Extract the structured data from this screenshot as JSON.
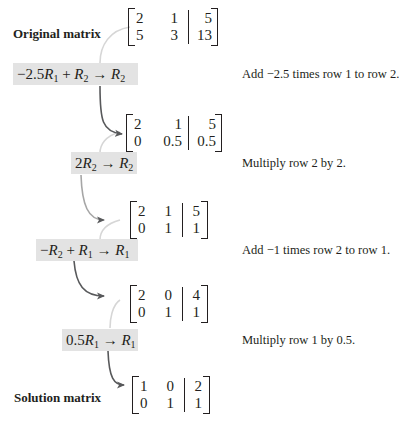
{
  "labels": {
    "original": "Original matrix",
    "solution": "Solution matrix"
  },
  "steps": [
    {
      "operation": {
        "coef": "−2.5",
        "r_a": "1",
        "plus": " + ",
        "r_b": "2",
        "arrow": " → ",
        "r_target": "2"
      },
      "description": "Add −2.5 times row 1 to row 2."
    },
    {
      "operation": {
        "coef": "2",
        "r_a": "2",
        "arrow": " → ",
        "r_target": "2"
      },
      "description": "Multiply row 2 by 2."
    },
    {
      "operation": {
        "coef": "−",
        "r_a": "2",
        "plus": " + ",
        "r_b": "1",
        "arrow": " → ",
        "r_target": "1"
      },
      "description": "Add −1 times row 2 to row 1."
    },
    {
      "operation": {
        "coef": "0.5",
        "r_a": "1",
        "arrow": " → ",
        "r_target": "1"
      },
      "description": "Multiply row 1 by 0.5."
    }
  ],
  "matrices": [
    {
      "rows": [
        [
          "2",
          "1",
          "5"
        ],
        [
          "5",
          "3",
          "13"
        ]
      ]
    },
    {
      "rows": [
        [
          "2",
          "1",
          "5"
        ],
        [
          "0",
          "0.5",
          "0.5"
        ]
      ]
    },
    {
      "rows": [
        [
          "2",
          "1",
          "5"
        ],
        [
          "0",
          "1",
          "1"
        ]
      ]
    },
    {
      "rows": [
        [
          "2",
          "0",
          "4"
        ],
        [
          "0",
          "1",
          "1"
        ]
      ]
    },
    {
      "rows": [
        [
          "1",
          "0",
          "2"
        ],
        [
          "0",
          "1",
          "1"
        ]
      ]
    }
  ],
  "colors": {
    "highlight": "#e3e3e3",
    "arrow_dark": "#58595b",
    "arrow_light": "#d0d0d0",
    "text": "#231f20"
  }
}
